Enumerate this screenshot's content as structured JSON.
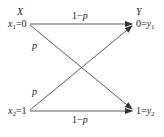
{
  "diagram": {
    "type": "binary symmetric channel",
    "input_set_label": "X",
    "output_set_label": "Y",
    "inputs": [
      {
        "var": "x",
        "sub": "1",
        "value": "=0"
      },
      {
        "var": "x",
        "sub": "2",
        "value": "=1"
      }
    ],
    "outputs": [
      {
        "value": "0=",
        "var": "y",
        "sub": "1"
      },
      {
        "value": "1=",
        "var": "y",
        "sub": "2"
      }
    ],
    "edges": [
      {
        "from": "x1",
        "to": "y1",
        "label_prefix": "1−",
        "label_var": "p"
      },
      {
        "from": "x1",
        "to": "y2",
        "label_var": "p"
      },
      {
        "from": "x2",
        "to": "y1",
        "label_var": "p"
      },
      {
        "from": "x2",
        "to": "y2",
        "label_prefix": "1−",
        "label_var": "p"
      }
    ],
    "colors": {
      "line": "#333333",
      "text": "#222222"
    }
  }
}
